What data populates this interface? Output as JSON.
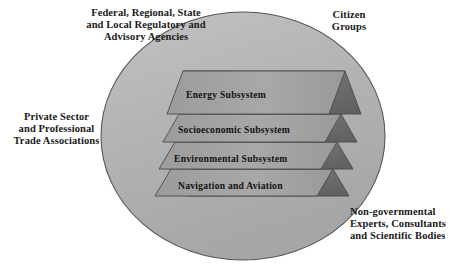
{
  "diagram": {
    "ellipse": {
      "name": "system-boundary-ellipse",
      "fill": "#b3b3b3",
      "stroke": "#4d4d4d"
    },
    "stakeholders": [
      {
        "id": "regulatory",
        "label": "Federal, Regional, State\nand Local Regulatory and\nAdvisory Agencies"
      },
      {
        "id": "citizen",
        "label": "Citizen\nGroups"
      },
      {
        "id": "private",
        "label": "Private Sector\nand Professional\nTrade Associations"
      },
      {
        "id": "ngo",
        "label": "Non-governmental\nExperts, Consultants\nand Scientific Bodies"
      }
    ],
    "layers": [
      {
        "id": "energy",
        "label": "Energy Subsystem",
        "top_fill": "#9a9a9a",
        "side_fill": "#6e6e6e"
      },
      {
        "id": "socioeconomic",
        "label": "Socioeconomic Subsystem",
        "top_fill": "#a2a2a2",
        "side_fill": "#6e6e6e"
      },
      {
        "id": "environmental",
        "label": "Environmental Subsystem",
        "top_fill": "#a2a2a2",
        "side_fill": "#6e6e6e"
      },
      {
        "id": "navigation",
        "label": "Navigation and Aviation",
        "top_fill": "#a6a6a6",
        "side_fill": "#6e6e6e"
      }
    ]
  }
}
